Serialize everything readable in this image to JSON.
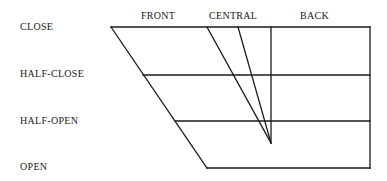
{
  "diagram": {
    "columns": [
      {
        "label": "FRONT",
        "x": 141
      },
      {
        "label": "CENTRAL",
        "x": 209
      },
      {
        "label": "BACK",
        "x": 300
      }
    ],
    "rows": [
      {
        "label": "CLOSE",
        "y": 22
      },
      {
        "label": "HALF-CLOSE",
        "y": 69
      },
      {
        "label": "HALF-OPEN",
        "y": 116
      },
      {
        "label": "OPEN",
        "y": 162
      }
    ],
    "line_color": "#1a1a1a"
  }
}
